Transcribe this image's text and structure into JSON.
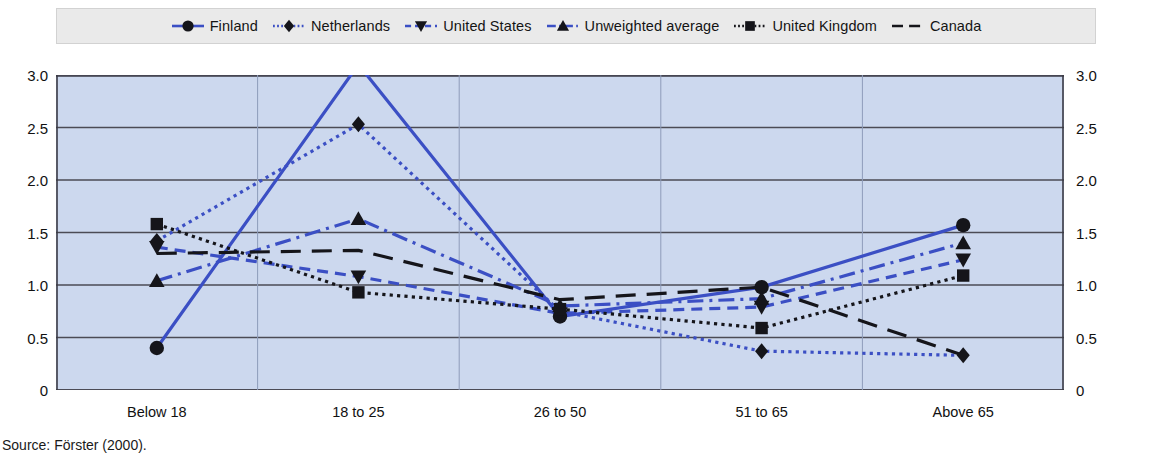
{
  "chart_data": {
    "type": "line",
    "title": "",
    "xlabel": "",
    "ylabel": "",
    "categories": [
      "Below 18",
      "18 to 25",
      "26 to 50",
      "51 to 65",
      "Above 65"
    ],
    "ylim": [
      0,
      3.0
    ],
    "yticks": [
      "0",
      "0.5",
      "1.0",
      "1.5",
      "2.0",
      "2.5",
      "3.0"
    ],
    "ytick_values": [
      0,
      0.5,
      1.0,
      1.5,
      2.0,
      2.5,
      3.0
    ],
    "grid": true,
    "grid_orientation": "horizontal",
    "dual_axis": true,
    "legend_position": "top",
    "plot_background": "#ccd8ee",
    "series": [
      {
        "name": "Finland",
        "values": [
          0.4,
          3.1,
          0.7,
          0.98,
          1.57
        ],
        "color": "#3b4fc4",
        "dash": "none",
        "marker": "circle"
      },
      {
        "name": "Netherlands",
        "values": [
          1.42,
          2.53,
          0.75,
          0.37,
          0.33
        ],
        "color": "#3b4fc4",
        "dash": "dotted",
        "marker": "diamond"
      },
      {
        "name": "United States",
        "values": [
          1.36,
          1.08,
          0.73,
          0.79,
          1.24
        ],
        "color": "#3b4fc4",
        "dash": "dashed",
        "marker": "triangle-down"
      },
      {
        "name": "Unweighted average",
        "values": [
          1.04,
          1.63,
          0.8,
          0.87,
          1.4
        ],
        "color": "#3b4fc4",
        "dash": "dash-dot",
        "marker": "triangle-up"
      },
      {
        "name": "United Kingdom",
        "values": [
          1.58,
          0.93,
          0.77,
          0.59,
          1.09
        ],
        "color": "#15151a",
        "dash": "dotted",
        "marker": "square"
      },
      {
        "name": "Canada",
        "values": [
          1.3,
          1.33,
          0.86,
          0.98,
          0.33
        ],
        "color": "#15151a",
        "dash": "long-dash",
        "marker": "none"
      }
    ]
  },
  "source": {
    "text": "Source:  Förster (2000)."
  }
}
